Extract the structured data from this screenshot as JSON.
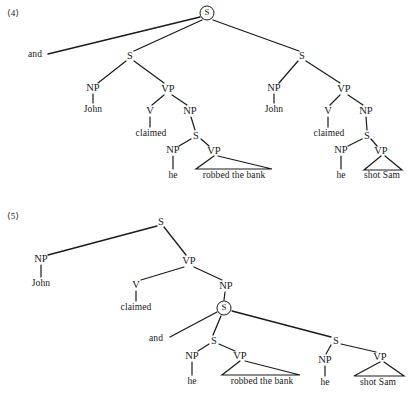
{
  "page": {
    "background": "#ffffff",
    "ink": "#1a1a1c",
    "width": 412,
    "height": 393
  },
  "examples": [
    {
      "id": "example-4",
      "number": "⟨4⟩",
      "description": "Coordination of two full sentences: John claimed he robbed the bank and John claimed he shot Sam",
      "root": {
        "label": "S",
        "circled": true
      },
      "conjunction": "and",
      "nodes": [
        {
          "name": "root-s-circled",
          "label": "S",
          "x": 207,
          "y": 13,
          "circled": true
        },
        {
          "name": "conjunction-and",
          "label": "and",
          "x": 35,
          "y": 55,
          "kind": "word"
        },
        {
          "name": "left-s",
          "label": "S",
          "x": 130,
          "y": 56,
          "kind": "cat"
        },
        {
          "name": "left-np-subject",
          "label": "NP",
          "x": 93,
          "y": 88,
          "kind": "cat"
        },
        {
          "name": "left-john",
          "label": "John",
          "x": 93,
          "y": 110,
          "kind": "word"
        },
        {
          "name": "left-vp",
          "label": "VP",
          "x": 168,
          "y": 89,
          "kind": "cat"
        },
        {
          "name": "left-v",
          "label": "V",
          "x": 150,
          "y": 111,
          "kind": "cat"
        },
        {
          "name": "left-claimed",
          "label": "claimed",
          "x": 151,
          "y": 134,
          "kind": "word"
        },
        {
          "name": "left-np-object",
          "label": "NP",
          "x": 190,
          "y": 111,
          "kind": "cat"
        },
        {
          "name": "left-embedded-s",
          "label": "S",
          "x": 196,
          "y": 136,
          "kind": "cat"
        },
        {
          "name": "left-embedded-np",
          "label": "NP",
          "x": 173,
          "y": 150,
          "kind": "cat"
        },
        {
          "name": "left-he",
          "label": "he",
          "x": 173,
          "y": 176,
          "kind": "word"
        },
        {
          "name": "left-embedded-vp",
          "label": "VP",
          "x": 214,
          "y": 151,
          "kind": "cat"
        },
        {
          "name": "left-robbed-the-bank",
          "label": "robbed the bank",
          "x": 234,
          "y": 176,
          "kind": "phrase"
        },
        {
          "name": "right-s",
          "label": "S",
          "x": 302,
          "y": 56,
          "kind": "cat"
        },
        {
          "name": "right-np-subject",
          "label": "NP",
          "x": 274,
          "y": 88,
          "kind": "cat"
        },
        {
          "name": "right-john",
          "label": "John",
          "x": 274,
          "y": 110,
          "kind": "word"
        },
        {
          "name": "right-vp",
          "label": "VP",
          "x": 344,
          "y": 89,
          "kind": "cat"
        },
        {
          "name": "right-v",
          "label": "V",
          "x": 328,
          "y": 111,
          "kind": "cat"
        },
        {
          "name": "right-claimed",
          "label": "claimed",
          "x": 329,
          "y": 134,
          "kind": "word"
        },
        {
          "name": "right-np-object",
          "label": "NP",
          "x": 366,
          "y": 111,
          "kind": "cat"
        },
        {
          "name": "right-embedded-s",
          "label": "S",
          "x": 367,
          "y": 136,
          "kind": "cat"
        },
        {
          "name": "right-embedded-np",
          "label": "NP",
          "x": 341,
          "y": 150,
          "kind": "cat"
        },
        {
          "name": "right-he",
          "label": "he",
          "x": 341,
          "y": 176,
          "kind": "word"
        },
        {
          "name": "right-embedded-vp",
          "label": "VP",
          "x": 381,
          "y": 151,
          "kind": "cat"
        },
        {
          "name": "right-shot-sam",
          "label": "shot Sam",
          "x": 382,
          "y": 176,
          "kind": "phrase"
        }
      ]
    },
    {
      "id": "example-5",
      "number": "⟨5⟩",
      "description": "Coordination inside the complement clause: John claimed he robbed the bank and he shot Sam",
      "root": {
        "label": "S",
        "circled": false
      },
      "conjunction": "and",
      "nodes": [
        {
          "name": "root-s",
          "label": "S",
          "x": 161,
          "y": 222,
          "kind": "cat"
        },
        {
          "name": "np-subject",
          "label": "NP",
          "x": 41,
          "y": 259,
          "kind": "cat"
        },
        {
          "name": "john",
          "label": "John",
          "x": 41,
          "y": 284,
          "kind": "word"
        },
        {
          "name": "vp",
          "label": "VP",
          "x": 189,
          "y": 261,
          "kind": "cat"
        },
        {
          "name": "v",
          "label": "V",
          "x": 136,
          "y": 285,
          "kind": "cat"
        },
        {
          "name": "claimed",
          "label": "claimed",
          "x": 136,
          "y": 308,
          "kind": "word"
        },
        {
          "name": "np-object",
          "label": "NP",
          "x": 226,
          "y": 286,
          "kind": "cat"
        },
        {
          "name": "coordinated-s-circled",
          "label": "S",
          "x": 224,
          "y": 308,
          "circled": true
        },
        {
          "name": "conjunction-and",
          "label": "and",
          "x": 156,
          "y": 339,
          "kind": "word"
        },
        {
          "name": "conj-left-s",
          "label": "S",
          "x": 214,
          "y": 341,
          "kind": "cat"
        },
        {
          "name": "conj-left-np",
          "label": "NP",
          "x": 192,
          "y": 356,
          "kind": "cat"
        },
        {
          "name": "conj-left-he",
          "label": "he",
          "x": 192,
          "y": 382,
          "kind": "word"
        },
        {
          "name": "conj-left-vp",
          "label": "VP",
          "x": 240,
          "y": 356,
          "kind": "cat"
        },
        {
          "name": "conj-left-robbed-the-bank",
          "label": "robbed the bank",
          "x": 262,
          "y": 382,
          "kind": "phrase"
        },
        {
          "name": "conj-right-s",
          "label": "S",
          "x": 336,
          "y": 341,
          "kind": "cat"
        },
        {
          "name": "conj-right-np",
          "label": "NP",
          "x": 325,
          "y": 360,
          "kind": "cat"
        },
        {
          "name": "conj-right-he",
          "label": "he",
          "x": 325,
          "y": 383,
          "kind": "word"
        },
        {
          "name": "conj-right-vp",
          "label": "VP",
          "x": 380,
          "y": 357,
          "kind": "cat"
        },
        {
          "name": "conj-right-shot-sam",
          "label": "shot Sam",
          "x": 378,
          "y": 383,
          "kind": "phrase"
        }
      ]
    }
  ],
  "labels": {
    "ex4_number": "⟨4⟩",
    "ex5_number": "⟨5⟩",
    "and": "and",
    "S": "S",
    "NP": "NP",
    "VP": "VP",
    "V": "V",
    "John": "John",
    "claimed": "claimed",
    "he": "he",
    "robbed_the_bank": "robbed the bank",
    "shot_Sam": "shot Sam"
  }
}
